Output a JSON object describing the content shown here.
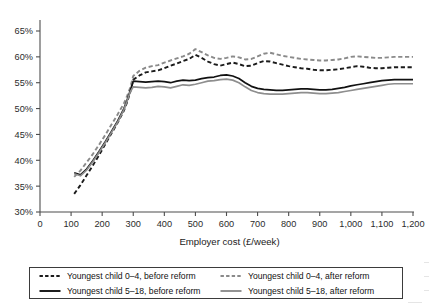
{
  "chart_data": {
    "type": "line",
    "title": "",
    "xlabel": "Employer cost (£/week)",
    "ylabel": "",
    "xlim": [
      0,
      1200
    ],
    "ylim": [
      30,
      65
    ],
    "xticks": [
      "0",
      "100",
      "200",
      "300",
      "400",
      "500",
      "600",
      "700",
      "800",
      "900",
      "1,000",
      "1,100",
      "1,200"
    ],
    "xtick_values": [
      0,
      100,
      200,
      300,
      400,
      500,
      600,
      700,
      800,
      900,
      1000,
      1100,
      1200
    ],
    "yticks": [
      "30%",
      "35%",
      "40%",
      "45%",
      "50%",
      "55%",
      "60%",
      "65%"
    ],
    "ytick_values": [
      30,
      35,
      40,
      45,
      50,
      55,
      60,
      65
    ],
    "grid": false,
    "legend_position": "below",
    "x": [
      110,
      130,
      150,
      170,
      190,
      210,
      230,
      250,
      270,
      280,
      290,
      300,
      320,
      340,
      360,
      380,
      400,
      420,
      440,
      460,
      480,
      500,
      520,
      540,
      560,
      580,
      600,
      620,
      640,
      660,
      680,
      700,
      720,
      740,
      760,
      780,
      800,
      820,
      840,
      860,
      880,
      900,
      920,
      940,
      960,
      980,
      1000,
      1020,
      1040,
      1060,
      1080,
      1100,
      1120,
      1140,
      1160,
      1180,
      1200
    ],
    "series": [
      {
        "name": "Youngest child 0–4, before reform",
        "style": "dashed",
        "color": "#1b1b1b",
        "values": [
          33.5,
          35.2,
          37.1,
          39.0,
          41.0,
          43.1,
          45.2,
          47.3,
          49.6,
          51.2,
          53.1,
          55.6,
          56.4,
          57.0,
          57.2,
          57.4,
          57.8,
          58.3,
          58.7,
          59.2,
          59.6,
          60.4,
          59.8,
          59.1,
          58.6,
          58.3,
          58.6,
          58.9,
          58.6,
          58.2,
          58.3,
          58.8,
          59.2,
          59.1,
          58.8,
          58.5,
          58.2,
          58.0,
          57.8,
          57.7,
          57.5,
          57.4,
          57.4,
          57.5,
          57.6,
          57.8,
          58.0,
          58.2,
          58.1,
          57.9,
          57.8,
          57.8,
          57.9,
          58.0,
          58.0,
          58.0,
          58.0
        ]
      },
      {
        "name": "Youngest child 0–4, after reform",
        "style": "dashed",
        "color": "#8a8a8a",
        "values": [
          36.8,
          38.0,
          39.6,
          41.2,
          43.0,
          44.9,
          46.9,
          48.9,
          51.0,
          52.4,
          54.0,
          56.3,
          57.3,
          57.9,
          58.2,
          58.4,
          58.9,
          59.3,
          59.7,
          60.1,
          60.6,
          61.5,
          60.9,
          60.3,
          59.8,
          59.6,
          59.8,
          60.1,
          59.9,
          59.5,
          59.6,
          60.1,
          60.6,
          60.8,
          60.5,
          60.2,
          60.0,
          59.8,
          59.6,
          59.5,
          59.4,
          59.3,
          59.3,
          59.4,
          59.5,
          59.7,
          60.0,
          60.1,
          60.0,
          59.9,
          59.8,
          59.8,
          59.9,
          60.0,
          60.0,
          60.0,
          60.0
        ]
      },
      {
        "name": "Youngest child 5–18, before reform",
        "style": "solid",
        "color": "#111111",
        "values": [
          37.6,
          37.2,
          38.3,
          39.9,
          41.7,
          43.6,
          45.6,
          47.6,
          50.0,
          51.6,
          53.4,
          55.3,
          55.2,
          55.1,
          55.2,
          55.3,
          55.2,
          55.0,
          55.3,
          55.5,
          55.4,
          55.5,
          55.8,
          56.0,
          56.1,
          56.4,
          56.5,
          56.3,
          55.8,
          55.0,
          54.3,
          53.9,
          53.7,
          53.6,
          53.5,
          53.5,
          53.6,
          53.7,
          53.8,
          53.8,
          53.7,
          53.6,
          53.6,
          53.7,
          53.9,
          54.1,
          54.4,
          54.6,
          54.8,
          55.0,
          55.2,
          55.4,
          55.5,
          55.6,
          55.6,
          55.6,
          55.6
        ]
      },
      {
        "name": "Youngest child 5–18, after reform",
        "style": "solid",
        "color": "#8e8e8e",
        "values": [
          37.4,
          37.0,
          38.1,
          39.7,
          41.5,
          43.4,
          45.4,
          47.4,
          49.8,
          51.4,
          53.2,
          54.2,
          54.1,
          54.0,
          54.1,
          54.3,
          54.2,
          54.0,
          54.3,
          54.6,
          54.5,
          54.7,
          55.0,
          55.3,
          55.4,
          55.6,
          55.7,
          55.5,
          55.0,
          54.2,
          53.5,
          53.1,
          52.9,
          52.8,
          52.8,
          52.8,
          52.9,
          53.0,
          53.1,
          53.1,
          53.0,
          52.9,
          52.9,
          53.0,
          53.1,
          53.3,
          53.5,
          53.7,
          53.9,
          54.1,
          54.3,
          54.5,
          54.7,
          54.8,
          54.8,
          54.8,
          54.8
        ]
      }
    ]
  },
  "legend": {
    "items": [
      {
        "label": "Youngest child 0–4, before reform",
        "style": "dashed",
        "color": "#1b1b1b"
      },
      {
        "label": "Youngest child 0–4, after reform",
        "style": "dashed",
        "color": "#8a8a8a"
      },
      {
        "label": "Youngest child 5–18, before reform",
        "style": "solid",
        "color": "#111111"
      },
      {
        "label": "Youngest child 5–18, after reform",
        "style": "solid",
        "color": "#8e8e8e"
      }
    ]
  },
  "colors": {
    "axis": "#4d4d4d",
    "text": "#1a1a1a",
    "background": "#ffffff"
  }
}
